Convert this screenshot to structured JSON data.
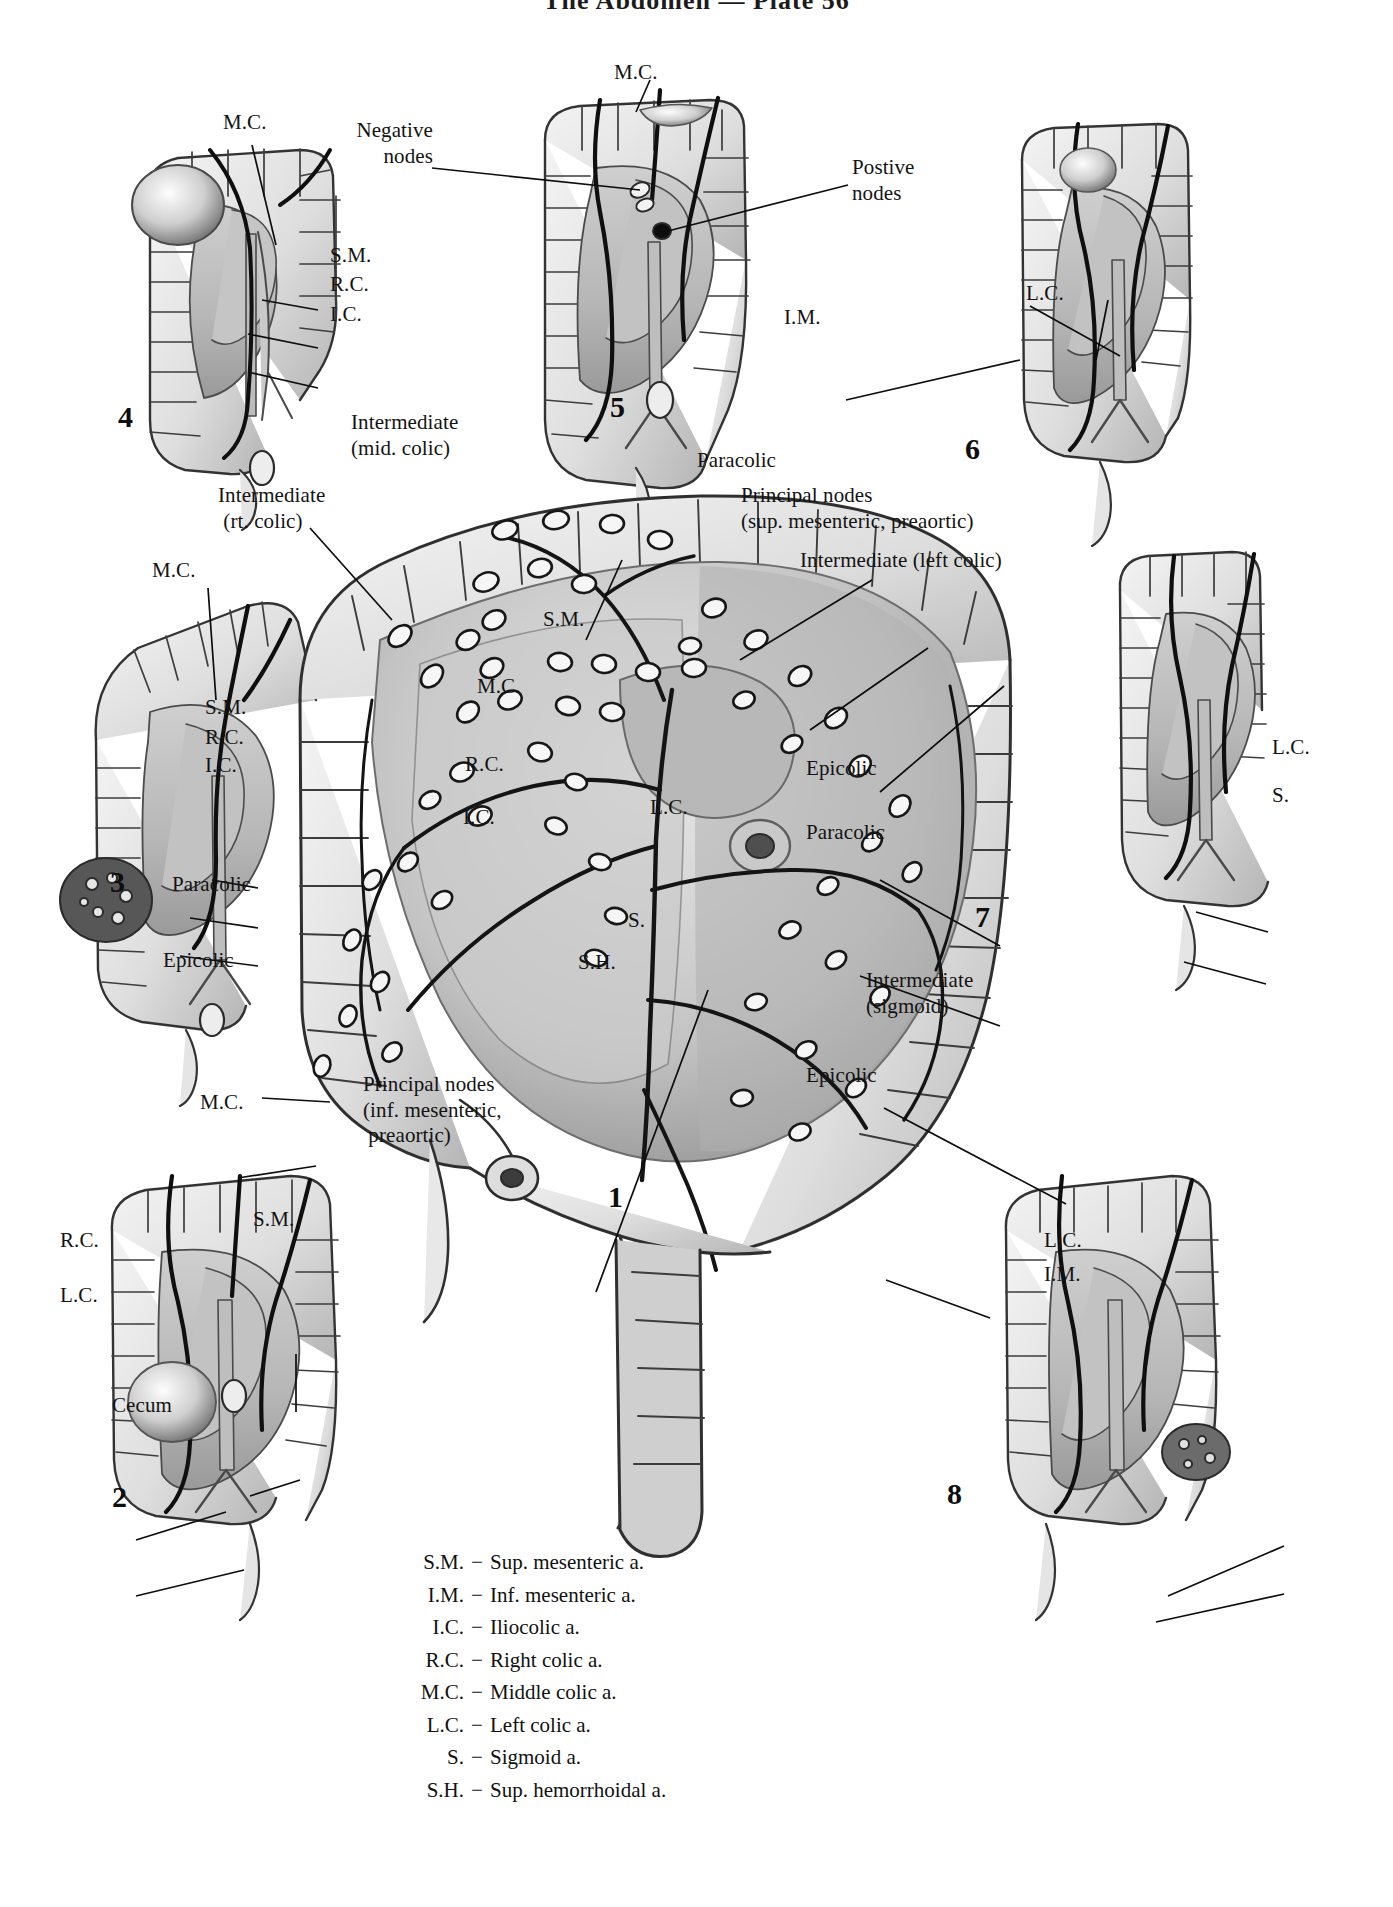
{
  "header": {
    "title": "The Abdomen — Plate 56"
  },
  "figures": [
    {
      "num": "1"
    },
    {
      "num": "2"
    },
    {
      "num": "3"
    },
    {
      "num": "4"
    },
    {
      "num": "5"
    },
    {
      "num": "6"
    },
    {
      "num": "7"
    },
    {
      "num": "8"
    }
  ],
  "figure4": {
    "mc": "M.C.",
    "sm": "S.M.",
    "rc": "R.C.",
    "ic": "I.C.",
    "number": "4"
  },
  "figure5": {
    "mc": "M.C.",
    "negative_nodes": "Negative\nnodes",
    "positive_nodes": "Postive\nnodes",
    "number": "5"
  },
  "figure6": {
    "im": "I.M.",
    "lc": "L.C.",
    "number": "6"
  },
  "figure3": {
    "intermediate_rt_colic": "Intermediate\n (rt. colic)",
    "mc": "M.C.",
    "sm": "S.M.",
    "rc": "R.C.",
    "ic": "I.C.",
    "paracolic": "Paracolic",
    "epicolic": "Epicolic",
    "number": "3"
  },
  "figure7": {
    "lc": "L.C.",
    "s": "S.",
    "number": "7"
  },
  "figure1": {
    "intermediate_mid_colic": "Intermediate\n(mid. colic)",
    "paracolic_top": "Paracolic",
    "principal_nodes_sup": "Principal nodes\n(sup. mesenteric, preaortic)",
    "intermediate_left_colic": "Intermediate (left colic)",
    "epicolic_right": "Epicolic",
    "paracolic_right": "Paracolic",
    "intermediate_sigmoid": "Intermediate\n(sigmoid)",
    "epicolic_bottom_right": "Epicolic",
    "principal_nodes_inf": "Principal nodes\n(inf. mesenteric,\n preaortic)",
    "sm": "S.M.",
    "mc": "M.C.",
    "rc": "R.C.",
    "ic": "I.C.",
    "lc": "L.C.",
    "s": "S.",
    "sh": "S.H.",
    "number": "1"
  },
  "figure2": {
    "mc": "M.C.",
    "sm": "S.M.",
    "rc": "R.C.",
    "lc": "L.C.",
    "cecum": "Cecum",
    "number": "2"
  },
  "figure8": {
    "lc": "L.C.",
    "im": "I.M.",
    "number": "8"
  },
  "key": {
    "rows": [
      {
        "abbr": "S.M.",
        "dash": "−",
        "desc": "Sup. mesenteric a."
      },
      {
        "abbr": "I.M.",
        "dash": "−",
        "desc": "Inf. mesenteric a."
      },
      {
        "abbr": "I.C.",
        "dash": "−",
        "desc": "Iliocolic a."
      },
      {
        "abbr": "R.C.",
        "dash": "−",
        "desc": "Right colic a."
      },
      {
        "abbr": "M.C.",
        "dash": "−",
        "desc": "Middle colic a."
      },
      {
        "abbr": "L.C.",
        "dash": "−",
        "desc": "Left colic a."
      },
      {
        "abbr": "S.",
        "dash": "−",
        "desc": "Sigmoid a."
      },
      {
        "abbr": "S.H.",
        "dash": "−",
        "desc": "Sup. hemorrhoidal a."
      }
    ]
  },
  "colors": {
    "ink": "#131313",
    "paper": "#ffffff",
    "mesentery_fill": "#b9b9b9",
    "bowel_fill": "#e2e2e2",
    "bowel_stroke": "#3a3a3a",
    "shade_dark": "#8d8d8d",
    "tumor": "#f2f2f2"
  }
}
